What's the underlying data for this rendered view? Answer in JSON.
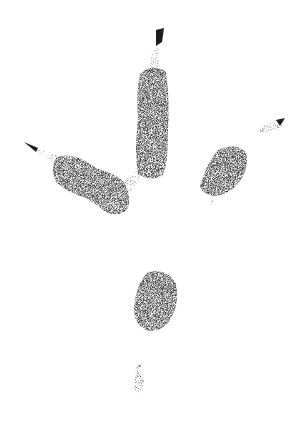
{
  "image": {
    "subject": "footprint track",
    "width": 302,
    "height": 434,
    "background": "#ffffff",
    "ink_color": "#3a3a3a",
    "claw_color": "#1e1e1e"
  },
  "elements": [
    {
      "name": "central-toe",
      "cx": 153,
      "cy": 120
    },
    {
      "name": "left-toe",
      "cx": 90,
      "cy": 182
    },
    {
      "name": "right-toe",
      "cx": 225,
      "cy": 172
    },
    {
      "name": "right-claw-mark",
      "cx": 272,
      "cy": 125
    },
    {
      "name": "heel-pad",
      "cx": 156,
      "cy": 300
    },
    {
      "name": "rear-claw-mark",
      "cx": 139,
      "cy": 377
    }
  ]
}
